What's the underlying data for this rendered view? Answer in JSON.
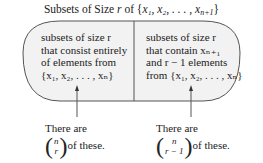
{
  "title": {
    "prefix": "Subsets of Size ",
    "var": "r",
    "of": " of {",
    "set": "x₁, x₂, . . . , x",
    "sub": "n+1",
    "close": "}"
  },
  "left_box": {
    "lines": [
      "subsets of size r",
      "that consist entirely",
      "of elements from",
      "{x₁, x₂, . . . , xₙ}"
    ]
  },
  "right_box": {
    "lines": [
      "subsets of size r",
      "that contain xₙ₊₁",
      "and r − 1 elements",
      "from {x₁, x₂, . . . , xₙ}"
    ]
  },
  "left_note": {
    "line1": "There are",
    "binom_top": "n",
    "binom_bottom": "r",
    "suffix": "of these."
  },
  "right_note": {
    "line1": "There are",
    "binom_top": "n",
    "binom_bottom": "r − 1",
    "suffix": "of these."
  },
  "colors": {
    "fill": "#f2f2f2",
    "stroke": "#555555"
  }
}
